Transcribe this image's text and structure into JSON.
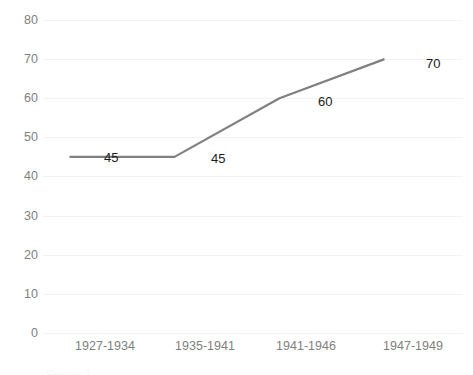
{
  "chart_data": {
    "type": "line",
    "title": "",
    "subtitle": "",
    "xlabel": "",
    "ylabel": "",
    "categories": [
      "1927-1934",
      "1935-1941",
      "1941-1946",
      "1947-1949"
    ],
    "values": [
      45,
      45,
      60,
      70
    ],
    "series": [
      {
        "name": "Series 1",
        "values": [
          45,
          45,
          60,
          70
        ]
      }
    ],
    "data_labels": [
      "45",
      "45",
      "60",
      "70"
    ],
    "ylim": [
      0,
      80
    ],
    "ytick_interval": 10,
    "yticks": [
      "80",
      "70",
      "60",
      "50",
      "40",
      "30",
      "20",
      "10",
      "0"
    ],
    "grid": true,
    "grid_axis": "y",
    "legend": "none",
    "markers": false,
    "colors": {
      "line": "#808080",
      "gridline": "#f2f2f2",
      "tick_label": "#808080",
      "data_label": "#1a1a1a",
      "background": "#ffffff"
    }
  }
}
